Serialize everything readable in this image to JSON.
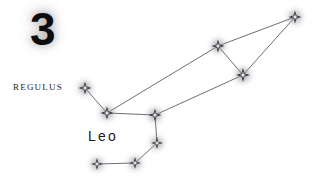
{
  "figure": {
    "width": 319,
    "height": 182,
    "background_color": "#ffffff",
    "plate_number": "3",
    "constellation_name": "Leo",
    "named_star": "Regulus",
    "line_color": "#6e6e74",
    "star_fill_color": "#f2f2f4",
    "star_stroke_color": "#2a2a30",
    "glow_color": "#8c8c94"
  },
  "labels": {
    "plate_number": {
      "text": "3",
      "x": 30,
      "y": 6
    },
    "regulus": {
      "text": "Regulus",
      "x": 13,
      "y": 79
    },
    "leo": {
      "text": "Leo",
      "x": 88,
      "y": 128
    }
  },
  "chart_data": {
    "type": "scatter",
    "title": "Leo",
    "xlabel": "",
    "ylabel": "",
    "xlim": [
      0,
      319
    ],
    "ylim": [
      0,
      182
    ],
    "grid": false,
    "legend": "none",
    "annotations": [
      "3",
      "Regulus",
      "Leo"
    ],
    "stars": [
      {
        "id": "regulus",
        "name": "Regulus",
        "x": 85,
        "y": 88,
        "size": 13
      },
      {
        "id": "eta_leo",
        "name": "Eta Leonis",
        "x": 107,
        "y": 113,
        "size": 13
      },
      {
        "id": "theta_leo",
        "name": "Chertan",
        "x": 155,
        "y": 115,
        "size": 13
      },
      {
        "id": "iota_leo",
        "name": "Iota Leonis",
        "x": 157,
        "y": 143,
        "size": 12
      },
      {
        "id": "sigma_leo",
        "name": "Sigma Leonis",
        "x": 135,
        "y": 163,
        "size": 12
      },
      {
        "id": "rho_leo",
        "name": "Rho Leonis",
        "x": 97,
        "y": 164,
        "size": 12
      },
      {
        "id": "zeta_leo",
        "name": "Adhafera",
        "x": 218,
        "y": 46,
        "size": 13
      },
      {
        "id": "gamma_leo",
        "name": "Algieba",
        "x": 243,
        "y": 75,
        "size": 14
      },
      {
        "id": "epsilon_leo",
        "name": "Ras Elased",
        "x": 295,
        "y": 17,
        "size": 13
      }
    ],
    "lines": [
      {
        "from": "regulus",
        "to": "eta_leo"
      },
      {
        "from": "eta_leo",
        "to": "theta_leo"
      },
      {
        "from": "eta_leo",
        "to": "zeta_leo"
      },
      {
        "from": "theta_leo",
        "to": "gamma_leo"
      },
      {
        "from": "theta_leo",
        "to": "iota_leo"
      },
      {
        "from": "iota_leo",
        "to": "sigma_leo"
      },
      {
        "from": "sigma_leo",
        "to": "rho_leo"
      },
      {
        "from": "zeta_leo",
        "to": "gamma_leo"
      },
      {
        "from": "zeta_leo",
        "to": "epsilon_leo"
      },
      {
        "from": "gamma_leo",
        "to": "epsilon_leo"
      }
    ]
  }
}
